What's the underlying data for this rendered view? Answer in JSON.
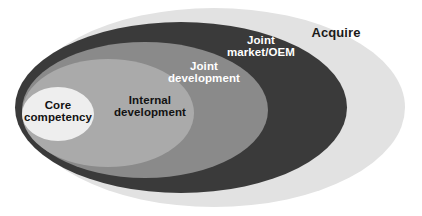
{
  "diagram": {
    "type": "nested-ellipse-venn",
    "background_color": "#ffffff",
    "layers": [
      {
        "id": "acquire",
        "label": "Acquire",
        "order": 1,
        "position": "outermost",
        "fill_color": "#e2e2e2",
        "text_color": "#1a1a1a",
        "ellipse": {
          "cx": 214,
          "cy": 107.5,
          "rx": 191,
          "ry": 99.5
        }
      },
      {
        "id": "joint-market-oem",
        "label": "Joint\nmarket/OEM",
        "label_line_1": "Joint",
        "label_line_2": "market/OEM",
        "order": 2,
        "fill_color": "#3a3a3a",
        "text_color": "#ffffff",
        "ellipse": {
          "cx": 181,
          "cy": 107.5,
          "rx": 166,
          "ry": 85.5
        }
      },
      {
        "id": "joint-development",
        "label": "Joint\ndevelopment",
        "label_line_1": "Joint",
        "label_line_2": "development",
        "order": 3,
        "fill_color": "#8a8a8a",
        "text_color": "#ffffff",
        "ellipse": {
          "cx": 145,
          "cy": 110,
          "rx": 123,
          "ry": 68
        }
      },
      {
        "id": "internal-development",
        "label": "Internal\ndevelopment",
        "label_line_1": "Internal",
        "label_line_2": "development",
        "order": 4,
        "fill_color": "#aaaaaa",
        "text_color": "#121212",
        "ellipse": {
          "cx": 108,
          "cy": 113,
          "rx": 86,
          "ry": 54
        }
      },
      {
        "id": "core-competency",
        "label": "Core\ncompetency",
        "label_line_1": "Core",
        "label_line_2": "competency",
        "order": 5,
        "position": "innermost",
        "fill_color": "#eeeeee",
        "text_color": "#121212",
        "ellipse": {
          "cx": 58,
          "cy": 114,
          "rx": 36,
          "ry": 27
        }
      }
    ]
  }
}
